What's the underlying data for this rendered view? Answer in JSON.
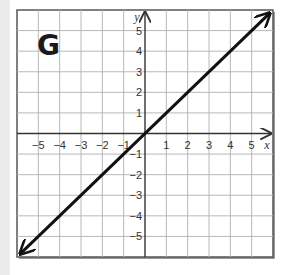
{
  "figure_label": "G",
  "chart_data": {
    "type": "line",
    "title": "G",
    "xlabel": "x",
    "ylabel": "y",
    "xlim": [
      -6,
      6
    ],
    "ylim": [
      -6,
      6
    ],
    "grid": true,
    "x_ticks": [
      -5,
      -4,
      -3,
      -2,
      -1,
      1,
      2,
      3,
      4,
      5
    ],
    "y_ticks": [
      5,
      4,
      3,
      2,
      1,
      -1,
      -2,
      -3,
      -4,
      -5
    ],
    "x_tick_labels": [
      "−5",
      "−4",
      "−3",
      "−2",
      "−1",
      "1",
      "2",
      "3",
      "4",
      "5"
    ],
    "y_tick_labels": [
      "5",
      "4",
      "3",
      "2",
      "1",
      "−1",
      "−2",
      "−3",
      "−4",
      "−5"
    ],
    "series": [
      {
        "name": "y = x",
        "x": [
          -6,
          6
        ],
        "y": [
          -6,
          6
        ],
        "arrows": "both",
        "color": "#111111"
      }
    ]
  },
  "colors": {
    "grid": "#b8b8b8",
    "axis": "#333333",
    "border": "#555555",
    "line": "#111111"
  }
}
